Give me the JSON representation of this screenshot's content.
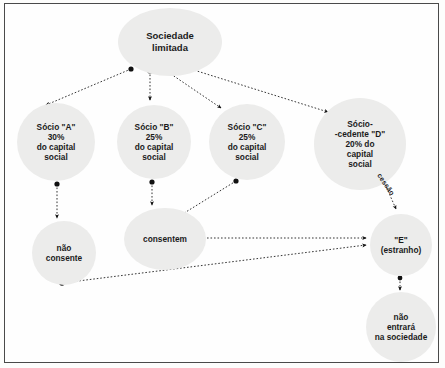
{
  "diagram": {
    "type": "flowchart",
    "language": "pt-BR",
    "colors": {
      "node_fill": "#ececeb",
      "text": "#1b1b1b",
      "edge": "#1b1b1b",
      "frame_border": "#4a4a4a",
      "background": "#fefefe"
    },
    "nodes": [
      {
        "id": "sociedade",
        "label": "Sociedade\nlimitada"
      },
      {
        "id": "socio_a",
        "label": "Sócio \"A\"\n30%\ndo capital\nsocial"
      },
      {
        "id": "socio_b",
        "label": "Sócio \"B\"\n25%\ndo capital\nsocial"
      },
      {
        "id": "socio_c",
        "label": "Sócio \"C\"\n25%\ndo capital\nsocial"
      },
      {
        "id": "socio_d",
        "label": "Sócio-\n-cedente \"D\"\n20% do\ncapital\nsocial"
      },
      {
        "id": "nao_consente",
        "label": "não\nconsente"
      },
      {
        "id": "consentem",
        "label": "consentem"
      },
      {
        "id": "e_estranho",
        "label": "\"E\"\n(estranho)"
      },
      {
        "id": "nao_entrara",
        "label": "não\nentrará\nna sociedade"
      }
    ],
    "edges": [
      {
        "from": "sociedade",
        "to": "socio_a",
        "label": ""
      },
      {
        "from": "sociedade",
        "to": "socio_b",
        "label": ""
      },
      {
        "from": "sociedade",
        "to": "socio_c",
        "label": ""
      },
      {
        "from": "sociedade",
        "to": "socio_d",
        "label": ""
      },
      {
        "from": "socio_a",
        "to": "nao_consente",
        "label": ""
      },
      {
        "from": "socio_b",
        "to": "consentem",
        "label": ""
      },
      {
        "from": "socio_c",
        "to": "consentem",
        "label": ""
      },
      {
        "from": "socio_d",
        "to": "e_estranho",
        "label": "cessão"
      },
      {
        "from": "consentem",
        "to": "e_estranho",
        "label": ""
      },
      {
        "from": "nao_consente",
        "to": "e_estranho",
        "label": ""
      },
      {
        "from": "e_estranho",
        "to": "nao_entrara",
        "label": ""
      }
    ]
  }
}
